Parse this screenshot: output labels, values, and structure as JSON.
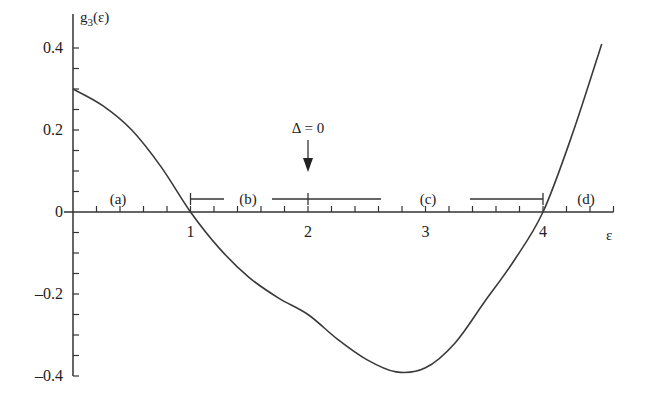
{
  "chart_data": {
    "type": "line",
    "title": "",
    "xlabel": "ε",
    "ylabel": "g3(ε)",
    "ylabel_parts": {
      "base": "g",
      "sub": "3",
      "arg": "(ε)"
    },
    "xlim": [
      0,
      4.6
    ],
    "ylim": [
      -0.4,
      0.4
    ],
    "grid": false,
    "legend": null,
    "x_ticks": [
      {
        "value": 1,
        "label": "1"
      },
      {
        "value": 2,
        "label": "2"
      },
      {
        "value": 3,
        "label": "3"
      },
      {
        "value": 4,
        "label": "4"
      }
    ],
    "x_minor_step": 0.2,
    "y_ticks": [
      {
        "value": 0.4,
        "label": "0.4"
      },
      {
        "value": 0.2,
        "label": "0.2"
      },
      {
        "value": 0,
        "label": "0"
      },
      {
        "value": -0.2,
        "label": "–0.2"
      },
      {
        "value": -0.4,
        "label": "–0.4"
      }
    ],
    "y_minor_step": 0.05,
    "series": [
      {
        "name": "g3(ε)",
        "x": [
          0,
          0.25,
          0.5,
          0.75,
          1.0,
          1.25,
          1.5,
          1.75,
          2.0,
          2.25,
          2.5,
          2.75,
          3.0,
          3.25,
          3.5,
          3.75,
          4.0,
          4.25,
          4.5
        ],
        "y": [
          0.3,
          0.26,
          0.2,
          0.11,
          0.0,
          -0.09,
          -0.16,
          -0.21,
          -0.25,
          -0.31,
          -0.36,
          -0.39,
          -0.38,
          -0.32,
          -0.22,
          -0.12,
          0.0,
          0.19,
          0.41
        ]
      }
    ],
    "annotations": [
      {
        "text": "Δ = 0",
        "x": 2,
        "y": 0.2,
        "arrow_to": {
          "x": 2,
          "y": 0.05
        }
      },
      {
        "text": "(a)",
        "x": 0.4,
        "y": 0.035
      },
      {
        "text": "(b)",
        "x": 1.5,
        "y": 0.035
      },
      {
        "text": "(c)",
        "x": 3.3,
        "y": 0.035
      },
      {
        "text": "(d)",
        "x": 4.35,
        "y": 0.035
      }
    ],
    "intervals": [
      {
        "label": "(b)",
        "start": 1.0,
        "end": 2.6,
        "start_cap": true,
        "mid_tick": 2.0,
        "y": 0.035
      },
      {
        "label": "(c)",
        "start": 2.65,
        "end": 4.0,
        "end_cap": true,
        "y": 0.035
      }
    ],
    "roots": [
      1.0,
      4.0
    ],
    "minimum": {
      "x": 2.75,
      "y": -0.39
    }
  }
}
